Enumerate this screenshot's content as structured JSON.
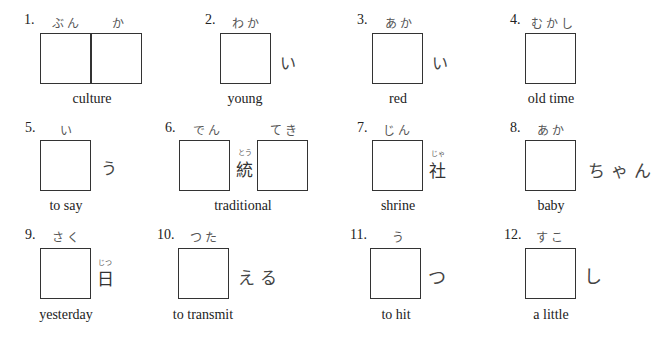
{
  "items": [
    {
      "number": "1.",
      "reading": [
        "ぶん",
        "か"
      ],
      "after": "",
      "english": "culture"
    },
    {
      "number": "2.",
      "reading": [
        "わか"
      ],
      "after": "い",
      "english": "young"
    },
    {
      "number": "3.",
      "reading": [
        "あか"
      ],
      "after": "い",
      "english": "red"
    },
    {
      "number": "4.",
      "reading": [
        "むかし"
      ],
      "after": "",
      "english": "old time"
    },
    {
      "number": "5.",
      "reading": [
        "い"
      ],
      "after": "う",
      "english": "to say"
    },
    {
      "number": "6.",
      "reading": [
        "でん",
        "てき"
      ],
      "middle_kanji": "統",
      "middle_furigana": "とう",
      "english": "traditional"
    },
    {
      "number": "7.",
      "reading": [
        "じん"
      ],
      "after_kanji": "社",
      "after_furigana": "じゃ",
      "english": "shrine"
    },
    {
      "number": "8.",
      "reading": [
        "あか"
      ],
      "after": "ちゃん",
      "english": "baby"
    },
    {
      "number": "9.",
      "reading": [
        "さく"
      ],
      "after_kanji": "日",
      "after_furigana": "じつ",
      "english": "yesterday"
    },
    {
      "number": "10.",
      "reading": [
        "つた"
      ],
      "after": "える",
      "english": "to transmit"
    },
    {
      "number": "11.",
      "reading": [
        "う"
      ],
      "after": "つ",
      "english": "to hit"
    },
    {
      "number": "12.",
      "reading": [
        "すこ"
      ],
      "after": "し",
      "english": "a little"
    }
  ]
}
